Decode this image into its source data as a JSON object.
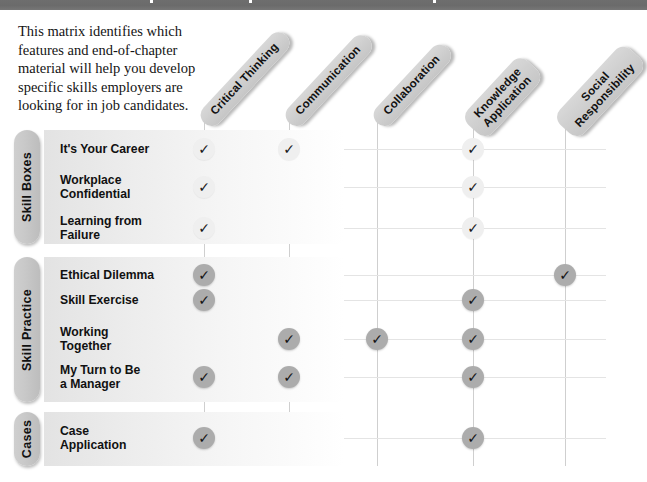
{
  "page": {
    "intro_text": "This matrix identifies which features and end-of-chapter material will help you develop specific skills employers are looking for in job candidates.",
    "topbar_color": "#6e6e6e",
    "pill_color": "#cfcfcf",
    "check_light_color": "#efefef",
    "check_dark_color": "#acacac",
    "check_glyph": "✓"
  },
  "columns": [
    {
      "id": "critical-thinking",
      "label": "Critical Thinking",
      "lines": [
        "Critical Thinking"
      ],
      "x": 204
    },
    {
      "id": "communication",
      "label": "Communication",
      "lines": [
        "Communication"
      ],
      "x": 289
    },
    {
      "id": "collaboration",
      "label": "Collaboration",
      "lines": [
        "Collaboration"
      ],
      "x": 377
    },
    {
      "id": "knowledge-application",
      "label": "Knowledge Application",
      "lines": [
        "Knowledge",
        "Application"
      ],
      "x": 473
    },
    {
      "id": "social-responsibility",
      "label": "Social Responsibility",
      "lines": [
        "Social",
        "Responsibility"
      ],
      "x": 565
    }
  ],
  "sections": [
    {
      "id": "skill-boxes",
      "label": "Skill Boxes",
      "check_style": "light",
      "top": 130,
      "height": 114,
      "rows": [
        {
          "id": "its-your-career",
          "label": "It's Your Career",
          "lines": [
            "It's Your Career"
          ],
          "y": 149,
          "checks": [
            "critical-thinking",
            "communication",
            "knowledge-application"
          ]
        },
        {
          "id": "workplace-confidential",
          "label": "Workplace Confidential",
          "lines": [
            "Workplace",
            "Confidential"
          ],
          "y": 187,
          "checks": [
            "critical-thinking",
            "knowledge-application"
          ]
        },
        {
          "id": "learning-from-failure",
          "label": "Learning from Failure",
          "lines": [
            "Learning from",
            "Failure"
          ],
          "y": 228,
          "checks": [
            "critical-thinking",
            "knowledge-application"
          ]
        }
      ]
    },
    {
      "id": "skill-practice",
      "label": "Skill Practice",
      "check_style": "dark",
      "top": 257,
      "height": 145,
      "rows": [
        {
          "id": "ethical-dilemma",
          "label": "Ethical Dilemma",
          "lines": [
            "Ethical Dilemma"
          ],
          "y": 275,
          "checks": [
            "critical-thinking",
            "social-responsibility"
          ]
        },
        {
          "id": "skill-exercise",
          "label": "Skill Exercise",
          "lines": [
            "Skill Exercise"
          ],
          "y": 300,
          "checks": [
            "critical-thinking",
            "knowledge-application"
          ]
        },
        {
          "id": "working-together",
          "label": "Working Together",
          "lines": [
            "Working",
            "Together"
          ],
          "y": 339,
          "checks": [
            "communication",
            "collaboration",
            "knowledge-application"
          ]
        },
        {
          "id": "my-turn-manager",
          "label": "My Turn to Be a Manager",
          "lines": [
            "My Turn to Be",
            "a Manager"
          ],
          "y": 377,
          "checks": [
            "critical-thinking",
            "communication",
            "knowledge-application"
          ]
        }
      ]
    },
    {
      "id": "cases",
      "label": "Cases",
      "check_style": "dark",
      "top": 412,
      "height": 54,
      "rows": [
        {
          "id": "case-application",
          "label": "Case Application",
          "lines": [
            "Case",
            "Application"
          ],
          "y": 438,
          "checks": [
            "critical-thinking",
            "knowledge-application"
          ]
        }
      ]
    }
  ]
}
